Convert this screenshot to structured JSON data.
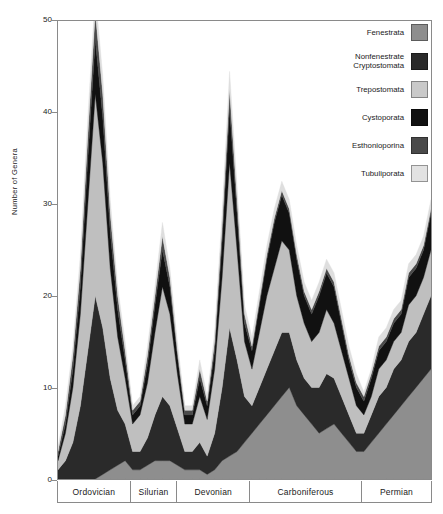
{
  "chart_data": {
    "type": "area",
    "stacked": true,
    "title": "",
    "xlabel": "",
    "ylabel": "Number of Genera",
    "ylim": [
      0,
      50
    ],
    "yticks": [
      0,
      10,
      20,
      30,
      40,
      50
    ],
    "grid": false,
    "legend_position": "top-right",
    "periods": [
      {
        "name": "Ordovician",
        "start": 0,
        "end": 19.5
      },
      {
        "name": "Silurian",
        "start": 19.5,
        "end": 32.0
      },
      {
        "name": "Devonian",
        "start": 32.0,
        "end": 51.5
      },
      {
        "name": "Carboniferous",
        "start": 51.5,
        "end": 81.5
      },
      {
        "name": "Permian",
        "start": 81.5,
        "end": 100
      }
    ],
    "x": [
      0,
      2,
      4,
      6,
      8,
      10,
      12,
      14,
      16,
      18,
      20,
      22,
      24,
      26,
      28,
      30,
      32,
      34,
      36,
      38,
      40,
      42,
      44,
      46,
      48,
      50,
      52,
      54,
      56,
      58,
      60,
      62,
      64,
      66,
      68,
      70,
      72,
      74,
      76,
      78,
      80,
      82,
      84,
      86,
      88,
      90,
      92,
      94,
      96,
      98,
      100
    ],
    "series": [
      {
        "name": "Fenestrata",
        "color": "#8e8e8e",
        "values": [
          0,
          0,
          0,
          0,
          0,
          0,
          0.5,
          1,
          1.5,
          2,
          1,
          1,
          1.5,
          2,
          2,
          2,
          1.5,
          1,
          1,
          1,
          0.5,
          1,
          2,
          2.5,
          3,
          4,
          5,
          6,
          7,
          8,
          9,
          10,
          8,
          7,
          6,
          5,
          5.5,
          6,
          5,
          4,
          3,
          3,
          4,
          5,
          6,
          7,
          8,
          9,
          10,
          11,
          12
        ]
      },
      {
        "name": "Nonfenestrate Cryptostomata",
        "color": "#2a2a2a",
        "values": [
          1,
          2,
          4,
          8,
          14,
          20,
          16,
          10,
          6,
          4,
          2,
          2,
          3,
          5,
          7,
          6,
          4,
          2,
          2,
          3,
          2,
          4,
          8,
          14,
          10,
          5,
          3,
          4,
          5,
          6,
          7,
          6,
          5,
          4,
          4,
          5,
          6,
          5,
          4,
          3,
          2,
          2,
          3,
          4,
          4,
          5,
          5,
          6,
          6,
          7,
          8
        ]
      },
      {
        "name": "Trepostomata",
        "color": "#bfbfbf",
        "values": [
          1,
          3,
          6,
          10,
          16,
          22,
          18,
          12,
          8,
          5,
          3,
          4,
          6,
          9,
          12,
          10,
          6,
          3,
          3,
          5,
          4,
          7,
          12,
          18,
          12,
          6,
          4,
          6,
          8,
          9,
          10,
          9,
          7,
          6,
          5,
          6,
          7,
          6,
          5,
          4,
          3,
          2,
          2,
          3,
          3,
          3,
          3,
          4,
          4,
          4,
          5
        ]
      },
      {
        "name": "Cystoporata",
        "color": "#111111",
        "values": [
          0.5,
          1,
          2,
          3,
          5,
          6,
          5,
          4,
          3,
          2,
          1,
          1,
          2,
          3,
          4,
          3,
          2,
          1,
          1,
          2,
          1.5,
          2,
          4,
          6,
          4,
          2,
          2,
          3,
          4,
          5,
          5,
          4,
          4,
          3,
          3,
          4,
          4,
          4,
          3,
          2,
          2,
          1.5,
          2,
          2,
          2,
          2,
          2,
          3,
          3,
          3,
          4
        ]
      },
      {
        "name": "Esthonioporina",
        "color": "#4a4a4a",
        "values": [
          0.5,
          1,
          1.5,
          2,
          2.5,
          3,
          2.5,
          2,
          1.5,
          1,
          0.5,
          0.5,
          1,
          1,
          1.5,
          1,
          0.5,
          0.5,
          0.5,
          1,
          0.5,
          1,
          1.5,
          2,
          1.5,
          1,
          0.5,
          0.5,
          0.5,
          0.5,
          0.5,
          0.5,
          0.5,
          0.5,
          0.5,
          0.5,
          0.5,
          0.5,
          0.5,
          0.5,
          0.5,
          0.5,
          0.5,
          0.5,
          0.5,
          0.5,
          0.5,
          0.5,
          0.5,
          0.5,
          0.5
        ]
      },
      {
        "name": "Tubuliporata",
        "color": "#dedede",
        "values": [
          0.5,
          1,
          1,
          1.5,
          2,
          2,
          2,
          1.5,
          1,
          1,
          0.5,
          0.5,
          1,
          1,
          1.5,
          1,
          1,
          0.5,
          0.5,
          1,
          0.5,
          1,
          1.5,
          2,
          1.5,
          1,
          1,
          1,
          1,
          1,
          1,
          1,
          1,
          1,
          1,
          1,
          1,
          1,
          1,
          1,
          1,
          0.5,
          0.5,
          1,
          1,
          1,
          1,
          1,
          1,
          1,
          1
        ]
      }
    ],
    "totals_peaks": [
      {
        "period": "Ordovician",
        "value": 46.5
      },
      {
        "period": "Silurian",
        "value": 24
      },
      {
        "period": "Devonian",
        "value": 39
      },
      {
        "period": "Carboniferous",
        "value": 31.5
      },
      {
        "period": "Permian",
        "value": 26
      }
    ]
  },
  "axis": {
    "y_label": "Number of Genera",
    "y_ticks": [
      "50",
      "40",
      "30",
      "20",
      "10",
      "0"
    ]
  },
  "legend": {
    "items": [
      {
        "label": "Fenestrata",
        "label_line2": "",
        "color": "#8e8e8e",
        "swatch": "fenestrata-swatch"
      },
      {
        "label": "Nonfenestrate",
        "label_line2": "Cryptostomata",
        "color": "#2a2a2a",
        "swatch": "nonfenestrate-cryptostomata-swatch"
      },
      {
        "label": "Trepostomata",
        "label_line2": "",
        "color": "#bfbfbf",
        "swatch": "trepostomata-swatch"
      },
      {
        "label": "Cystoporata",
        "label_line2": "",
        "color": "#111111",
        "swatch": "cystoporata-swatch"
      },
      {
        "label": "Esthonioporina",
        "label_line2": "",
        "color": "#4a4a4a",
        "swatch": "esthonioporina-swatch"
      },
      {
        "label": "Tubuliporata",
        "label_line2": "",
        "color": "#dedede",
        "swatch": "tubuliporata-swatch"
      }
    ]
  },
  "periods": {
    "items": [
      "Ordovician",
      "Silurian",
      "Devonian",
      "Carboniferous",
      "Permian"
    ]
  }
}
